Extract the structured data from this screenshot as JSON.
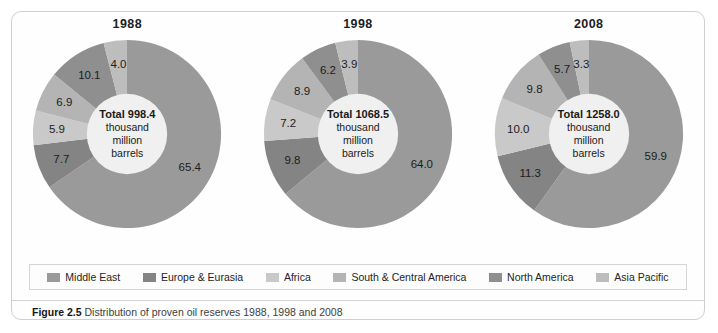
{
  "figure": {
    "caption_prefix": "Figure 2.5",
    "caption_text": "Distribution of proven oil reserves 1988, 1998 and 2008"
  },
  "legend": {
    "items": [
      {
        "label": "Middle East",
        "color": "#9a9a9a"
      },
      {
        "label": "Europe & Eurasia",
        "color": "#848484"
      },
      {
        "label": "Africa",
        "color": "#c9c9c9"
      },
      {
        "label": "South & Central America",
        "color": "#b4b4b4"
      },
      {
        "label": "North America",
        "color": "#8f8f8f"
      },
      {
        "label": "Asia  Pacific",
        "color": "#bdbdbd"
      }
    ]
  },
  "chart_data": [
    {
      "type": "pie",
      "title": "1988",
      "center_total_label": "Total 998.4",
      "center_unit_line1": "thousand",
      "center_unit_line2": "million",
      "center_unit_line3": "barrels",
      "total_value": 998.4,
      "total_units": "thousand million barrels",
      "categories": [
        "Middle East",
        "Europe & Eurasia",
        "Africa",
        "South & Central America",
        "North America",
        "Asia Pacific"
      ],
      "values": [
        65.4,
        7.7,
        5.9,
        6.9,
        10.1,
        4.0
      ],
      "colors": [
        "#9a9a9a",
        "#848484",
        "#c9c9c9",
        "#b4b4b4",
        "#8f8f8f",
        "#bdbdbd"
      ],
      "labels": [
        "65.4",
        "7.7",
        "5.9",
        "6.9",
        "10.1",
        "4.0"
      ],
      "units": "percent",
      "legend_position": "bottom"
    },
    {
      "type": "pie",
      "title": "1998",
      "center_total_label": "Total 1068.5",
      "center_unit_line1": "thousand",
      "center_unit_line2": "million",
      "center_unit_line3": "barrels",
      "total_value": 1068.5,
      "total_units": "thousand million barrels",
      "categories": [
        "Middle East",
        "Europe & Eurasia",
        "Africa",
        "South & Central America",
        "North America",
        "Asia Pacific"
      ],
      "values": [
        64.0,
        9.8,
        7.2,
        8.9,
        6.2,
        3.9
      ],
      "colors": [
        "#9a9a9a",
        "#848484",
        "#c9c9c9",
        "#b4b4b4",
        "#8f8f8f",
        "#bdbdbd"
      ],
      "labels": [
        "64.0",
        "9.8",
        "7.2",
        "8.9",
        "6.2",
        "3.9"
      ],
      "units": "percent",
      "legend_position": "bottom"
    },
    {
      "type": "pie",
      "title": "2008",
      "center_total_label": "Total 1258.0",
      "center_unit_line1": "thousand",
      "center_unit_line2": "million",
      "center_unit_line3": "barrels",
      "total_value": 1258.0,
      "total_units": "thousand million barrels",
      "categories": [
        "Middle East",
        "Europe & Eurasia",
        "Africa",
        "South & Central America",
        "North America",
        "Asia Pacific"
      ],
      "values": [
        59.9,
        11.3,
        10.0,
        9.8,
        5.7,
        3.3
      ],
      "colors": [
        "#9a9a9a",
        "#848484",
        "#c9c9c9",
        "#b4b4b4",
        "#8f8f8f",
        "#bdbdbd"
      ],
      "labels": [
        "59.9",
        "11.3",
        "10.0",
        "9.8",
        "5.7",
        "3.3"
      ],
      "units": "percent",
      "legend_position": "bottom"
    }
  ]
}
